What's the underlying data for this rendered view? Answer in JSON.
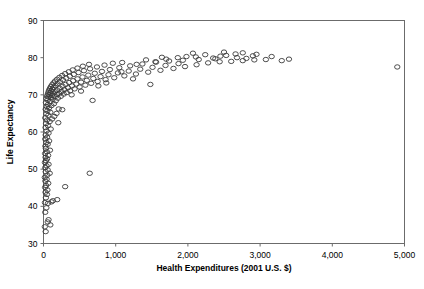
{
  "chart_data": {
    "type": "scatter",
    "title": "",
    "xlabel": "Health Expenditures (2001 U.S. $)",
    "ylabel": "Life Expectancy",
    "xlim": [
      0,
      5000
    ],
    "ylim": [
      30,
      90
    ],
    "xticks": [
      0,
      1000,
      2000,
      3000,
      4000,
      5000
    ],
    "xticklabels": [
      "0",
      "1,000",
      "2,000",
      "3,000",
      "4,000",
      "5,000"
    ],
    "yticks": [
      30,
      40,
      50,
      60,
      70,
      80,
      90
    ],
    "yticklabels": [
      "30",
      "40",
      "50",
      "60",
      "70",
      "80",
      "90"
    ],
    "grid": false,
    "legend": false,
    "marker": "open-circle",
    "marker_color": "#3a3a3a",
    "frame_color": "#6b6b6b",
    "points": [
      [
        18,
        34.5
      ],
      [
        30,
        33.2
      ],
      [
        58,
        35.8
      ],
      [
        70,
        36.4
      ],
      [
        95,
        35.0
      ],
      [
        24,
        38.4
      ],
      [
        40,
        39.6
      ],
      [
        62,
        40.8
      ],
      [
        110,
        41.2
      ],
      [
        130,
        41.5
      ],
      [
        20,
        41.0
      ],
      [
        33,
        42.3
      ],
      [
        48,
        43.2
      ],
      [
        28,
        43.8
      ],
      [
        55,
        44.4
      ],
      [
        190,
        41.8
      ],
      [
        22,
        45.1
      ],
      [
        36,
        45.6
      ],
      [
        66,
        46.2
      ],
      [
        300,
        45.3
      ],
      [
        26,
        46.8
      ],
      [
        44,
        47.3
      ],
      [
        18,
        47.8
      ],
      [
        52,
        48.4
      ],
      [
        86,
        48.9
      ],
      [
        30,
        49.3
      ],
      [
        58,
        49.8
      ],
      [
        24,
        50.4
      ],
      [
        42,
        50.9
      ],
      [
        70,
        51.3
      ],
      [
        640,
        48.9
      ],
      [
        20,
        51.8
      ],
      [
        34,
        52.3
      ],
      [
        50,
        52.8
      ],
      [
        28,
        53.2
      ],
      [
        64,
        53.7
      ],
      [
        22,
        54.2
      ],
      [
        46,
        54.7
      ],
      [
        90,
        55.1
      ],
      [
        32,
        55.6
      ],
      [
        26,
        56.2
      ],
      [
        58,
        56.7
      ],
      [
        40,
        57.2
      ],
      [
        78,
        57.6
      ],
      [
        24,
        58.1
      ],
      [
        50,
        58.6
      ],
      [
        30,
        59.2
      ],
      [
        70,
        59.7
      ],
      [
        44,
        60.3
      ],
      [
        100,
        60.8
      ],
      [
        28,
        61.2
      ],
      [
        62,
        61.7
      ],
      [
        36,
        62.3
      ],
      [
        86,
        62.8
      ],
      [
        48,
        63.2
      ],
      [
        24,
        63.8
      ],
      [
        120,
        63.5
      ],
      [
        150,
        64.2
      ],
      [
        66,
        64.5
      ],
      [
        40,
        64.9
      ],
      [
        95,
        65.3
      ],
      [
        54,
        65.7
      ],
      [
        180,
        65.0
      ],
      [
        30,
        66.1
      ],
      [
        78,
        66.5
      ],
      [
        210,
        66.2
      ],
      [
        46,
        66.8
      ],
      [
        110,
        67.1
      ],
      [
        62,
        67.4
      ],
      [
        145,
        67.6
      ],
      [
        34,
        67.9
      ],
      [
        88,
        68.2
      ],
      [
        170,
        68.4
      ],
      [
        56,
        68.6
      ],
      [
        125,
        68.8
      ],
      [
        42,
        69.0
      ],
      [
        100,
        69.2
      ],
      [
        200,
        69.1
      ],
      [
        70,
        69.4
      ],
      [
        155,
        69.5
      ],
      [
        50,
        69.7
      ],
      [
        115,
        69.8
      ],
      [
        240,
        69.6
      ],
      [
        82,
        70.0
      ],
      [
        185,
        70.1
      ],
      [
        60,
        70.2
      ],
      [
        135,
        70.3
      ],
      [
        280,
        70.2
      ],
      [
        96,
        70.5
      ],
      [
        215,
        70.4
      ],
      [
        68,
        70.7
      ],
      [
        160,
        70.8
      ],
      [
        320,
        70.6
      ],
      [
        108,
        71.0
      ],
      [
        250,
        70.9
      ],
      [
        76,
        71.2
      ],
      [
        190,
        71.3
      ],
      [
        370,
        71.1
      ],
      [
        122,
        71.5
      ],
      [
        290,
        71.4
      ],
      [
        88,
        71.7
      ],
      [
        225,
        71.8
      ],
      [
        430,
        71.6
      ],
      [
        140,
        72.0
      ],
      [
        340,
        71.9
      ],
      [
        102,
        72.2
      ],
      [
        265,
        72.3
      ],
      [
        500,
        72.1
      ],
      [
        165,
        72.5
      ],
      [
        395,
        72.4
      ],
      [
        118,
        72.7
      ],
      [
        305,
        72.8
      ],
      [
        580,
        72.6
      ],
      [
        195,
        73.0
      ],
      [
        455,
        72.9
      ],
      [
        138,
        73.2
      ],
      [
        355,
        73.3
      ],
      [
        660,
        73.1
      ],
      [
        230,
        73.5
      ],
      [
        520,
        73.4
      ],
      [
        160,
        73.7
      ],
      [
        410,
        73.8
      ],
      [
        750,
        73.6
      ],
      [
        270,
        74.0
      ],
      [
        600,
        73.9
      ],
      [
        188,
        74.2
      ],
      [
        470,
        74.3
      ],
      [
        860,
        74.1
      ],
      [
        315,
        74.5
      ],
      [
        690,
        74.4
      ],
      [
        220,
        74.7
      ],
      [
        540,
        74.8
      ],
      [
        980,
        74.6
      ],
      [
        365,
        75.0
      ],
      [
        790,
        74.9
      ],
      [
        258,
        75.2
      ],
      [
        620,
        75.3
      ],
      [
        1120,
        75.1
      ],
      [
        420,
        75.5
      ],
      [
        900,
        75.4
      ],
      [
        300,
        75.7
      ],
      [
        710,
        75.8
      ],
      [
        1280,
        75.6
      ],
      [
        485,
        76.0
      ],
      [
        1030,
        75.9
      ],
      [
        350,
        76.2
      ],
      [
        810,
        76.3
      ],
      [
        1450,
        76.1
      ],
      [
        560,
        76.5
      ],
      [
        1180,
        76.4
      ],
      [
        405,
        76.7
      ],
      [
        920,
        76.8
      ],
      [
        1620,
        76.6
      ],
      [
        645,
        77.0
      ],
      [
        1340,
        76.9
      ],
      [
        470,
        77.2
      ],
      [
        1050,
        77.3
      ],
      [
        1800,
        77.1
      ],
      [
        740,
        77.5
      ],
      [
        1510,
        77.4
      ],
      [
        545,
        77.7
      ],
      [
        1200,
        77.8
      ],
      [
        1960,
        77.6
      ],
      [
        845,
        78.0
      ],
      [
        1690,
        77.9
      ],
      [
        630,
        78.2
      ],
      [
        1370,
        78.3
      ],
      [
        2120,
        78.1
      ],
      [
        960,
        78.5
      ],
      [
        1870,
        78.4
      ],
      [
        1090,
        78.7
      ],
      [
        2280,
        78.6
      ],
      [
        1560,
        78.8
      ],
      [
        2440,
        78.9
      ],
      [
        1740,
        79.1
      ],
      [
        2600,
        79.0
      ],
      [
        1930,
        79.3
      ],
      [
        2760,
        79.2
      ],
      [
        2150,
        79.5
      ],
      [
        2920,
        79.4
      ],
      [
        2380,
        79.7
      ],
      [
        2110,
        80.2
      ],
      [
        2450,
        80.4
      ],
      [
        2680,
        80.0
      ],
      [
        2350,
        79.9
      ],
      [
        1640,
        80.1
      ],
      [
        1980,
        80.3
      ],
      [
        2810,
        79.8
      ],
      [
        3080,
        79.5
      ],
      [
        3300,
        79.2
      ],
      [
        2530,
        80.6
      ],
      [
        2240,
        80.8
      ],
      [
        2900,
        80.5
      ],
      [
        2660,
        81.0
      ],
      [
        2070,
        81.2
      ],
      [
        1550,
        78.9
      ],
      [
        1420,
        79.4
      ],
      [
        1700,
        79.6
      ],
      [
        1860,
        80.0
      ],
      [
        1290,
        78.2
      ],
      [
        2950,
        80.9
      ],
      [
        3160,
        80.3
      ],
      [
        2760,
        81.3
      ],
      [
        2500,
        81.5
      ],
      [
        3400,
        79.6
      ],
      [
        1080,
        76.2
      ],
      [
        1240,
        74.3
      ],
      [
        870,
        73.2
      ],
      [
        760,
        72.4
      ],
      [
        1480,
        72.8
      ],
      [
        520,
        71.0
      ],
      [
        390,
        70.0
      ],
      [
        680,
        68.5
      ],
      [
        260,
        66.0
      ],
      [
        205,
        62.5
      ],
      [
        4900,
        77.5
      ]
    ]
  }
}
